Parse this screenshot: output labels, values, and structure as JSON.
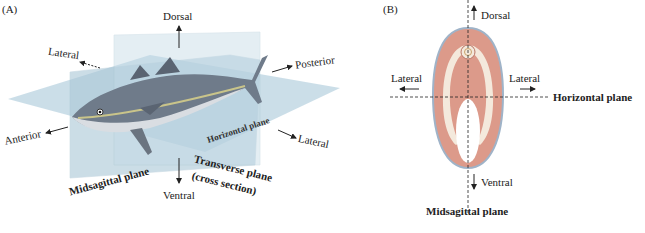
{
  "panel_a": {
    "tag": "(A)",
    "labels": {
      "dorsal": "Dorsal",
      "ventral": "Ventral",
      "anterior": "Anterior",
      "posterior": "Posterior",
      "lateral_left": "Lateral",
      "lateral_right": "Lateral",
      "horizontal_plane": "Horizontal plane",
      "midsagittal_plane": "Midsagittal plane",
      "transverse_plane_line1": "Transverse plane",
      "transverse_plane_line2": "(cross section)"
    },
    "colors": {
      "plane": "#b9d3e0",
      "plane_edge": "#a6c2d2",
      "fish_body": "#6f7b8a",
      "fish_belly": "#d9dde2",
      "fish_stripe": "#c9c48a"
    }
  },
  "panel_b": {
    "tag": "(B)",
    "labels": {
      "dorsal": "Dorsal",
      "ventral": "Ventral",
      "lateral_left": "Lateral",
      "lateral_right": "Lateral",
      "horizontal_plane": "Horizontal plane",
      "midsagittal_plane": "Midsagittal plane"
    },
    "colors": {
      "body_fill": "#dc9a8a",
      "body_outline": "#9fb3c8",
      "inner_band": "#f4e9dc",
      "cavity": "#ffffff"
    }
  }
}
